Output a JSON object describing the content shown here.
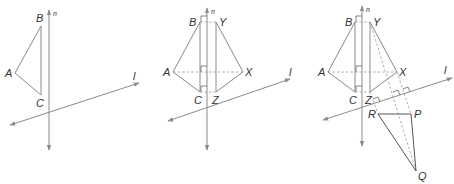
{
  "colors": {
    "line": "#8a8a8a",
    "dark": "#555555",
    "label": "#333333"
  },
  "panels": [
    {
      "id": "panel-1",
      "labels": {
        "B": "B",
        "A": "A",
        "C": "C",
        "n": "n",
        "l": "l"
      }
    },
    {
      "id": "panel-2",
      "labels": {
        "B": "B",
        "Y": "Y",
        "A": "A",
        "X": "X",
        "C": "C",
        "Z": "Z",
        "n": "n",
        "l": "l"
      }
    },
    {
      "id": "panel-3",
      "labels": {
        "B": "B",
        "Y": "Y",
        "A": "A",
        "X": "X",
        "C": "C",
        "Z": "Z",
        "R": "R",
        "P": "P",
        "Q": "Q",
        "n": "n",
        "l": "l"
      }
    }
  ]
}
